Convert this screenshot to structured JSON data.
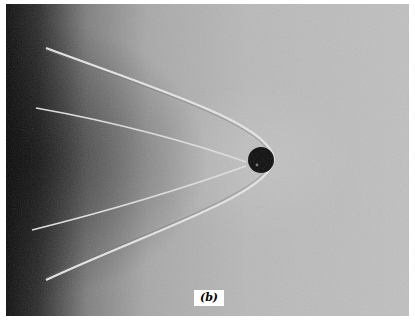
{
  "figure": {
    "panel_label": "(b)",
    "colors": {
      "background_light": "#c2c2c2",
      "background_mid": "#a8a8a8",
      "left_dark": "#101010",
      "sphere": "#0a0a0a",
      "shock_line": "#e8e8e8"
    }
  }
}
